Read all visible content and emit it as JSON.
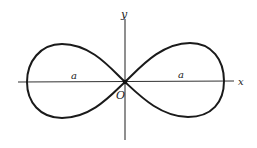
{
  "diagram": {
    "type": "lemniscate",
    "labels": {
      "y_axis": "y",
      "x_axis": "x",
      "origin": "O",
      "left_segment": "a",
      "right_segment": "a"
    },
    "colors": {
      "stroke": "#1a1a1a",
      "axis": "#333333",
      "background": "#ffffff"
    }
  }
}
